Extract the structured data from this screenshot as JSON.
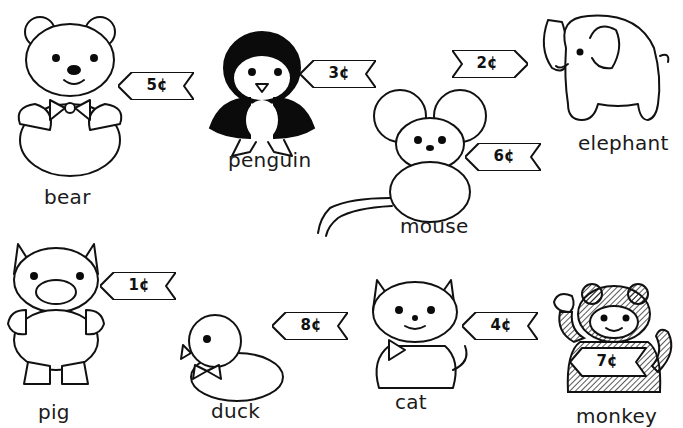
{
  "worksheet": {
    "currency_symbol": "¢",
    "items": [
      {
        "id": "bear",
        "name": "bear",
        "price": "5¢",
        "cents": 5
      },
      {
        "id": "penguin",
        "name": "penguin",
        "price": "3¢",
        "cents": 3
      },
      {
        "id": "elephant",
        "name": "elephant",
        "price": "2¢",
        "cents": 2
      },
      {
        "id": "mouse",
        "name": "mouse",
        "price": "6¢",
        "cents": 6
      },
      {
        "id": "pig",
        "name": "pig",
        "price": "1¢",
        "cents": 1
      },
      {
        "id": "duck",
        "name": "duck",
        "price": "8¢",
        "cents": 8
      },
      {
        "id": "cat",
        "name": "cat",
        "price": "4¢",
        "cents": 4
      },
      {
        "id": "monkey",
        "name": "monkey",
        "price": "7¢",
        "cents": 7
      }
    ]
  },
  "colors": {
    "line": "#111111",
    "background": "#ffffff"
  }
}
